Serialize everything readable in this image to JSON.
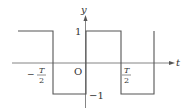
{
  "diagram": {
    "type": "square-wave",
    "axes": {
      "x_label": "t",
      "y_label": "y",
      "origin_label": "O"
    },
    "ticks": {
      "y_high": "1",
      "y_low": "−1",
      "neg_half_period": {
        "sign": "−",
        "numerator": "T",
        "denominator": "2"
      },
      "pos_half_period": {
        "numerator": "T",
        "denominator": "2"
      }
    },
    "colors": {
      "line": "#555555",
      "text": "#333333",
      "background": "#ffffff"
    }
  }
}
